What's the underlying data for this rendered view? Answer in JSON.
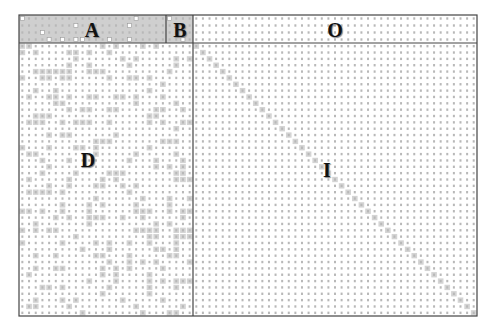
{
  "figure": {
    "frame": {
      "left": 19,
      "top": 15,
      "right": 477,
      "bottom": 316
    },
    "dividers": {
      "header_row_bottom": 43,
      "a_b_split": 166,
      "left_right_split": 193
    },
    "grid": {
      "left_cols": 26,
      "right_cols": 43,
      "header_rows": 4,
      "body_rows": 43
    },
    "colors": {
      "frame": "#444444",
      "dot": "#b8b8b8",
      "shade": "#d4d4d4",
      "header_shade": "#cfcfcf",
      "open_dot": "#ffffff"
    },
    "labels": {
      "A": {
        "text": "A",
        "x": 92,
        "y": 30
      },
      "B": {
        "text": "B",
        "x": 180,
        "y": 30
      },
      "O": {
        "text": "O",
        "x": 335,
        "y": 30
      },
      "D": {
        "text": "D",
        "x": 88,
        "y": 160
      },
      "I": {
        "text": "I",
        "x": 327,
        "y": 170
      }
    }
  }
}
